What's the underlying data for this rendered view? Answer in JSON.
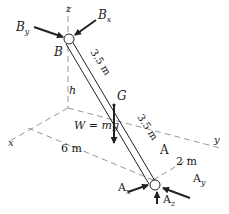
{
  "diagram": {
    "axes": {
      "x": "x",
      "y": "y",
      "z": "z"
    },
    "points": {
      "B": "B",
      "A": "A",
      "G": "G"
    },
    "forces": {
      "Bx": {
        "label": "B",
        "sub": "x"
      },
      "By": {
        "label": "B",
        "sub": "y"
      },
      "Ax": {
        "label": "A",
        "sub": "x"
      },
      "Ay": {
        "label": "A",
        "sub": "y"
      },
      "Az": {
        "label": "A",
        "sub": "z"
      },
      "W": "W = mg"
    },
    "dimensions": {
      "BG": "3.5 m",
      "GA": "3.5 m",
      "h": "h",
      "x_dist": "6 m",
      "y_dist": "2 m"
    },
    "colors": {
      "line": "#222222",
      "dashed": "#8a8a8a",
      "background": "#ffffff"
    }
  }
}
